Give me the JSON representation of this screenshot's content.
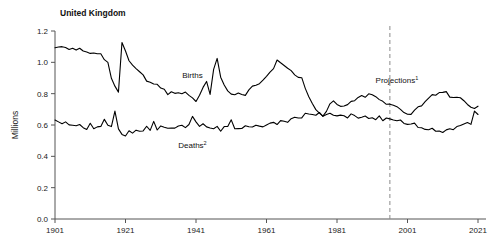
{
  "chart_data": {
    "type": "line",
    "title": "United Kingdom",
    "xlabel": "",
    "ylabel": "Millions",
    "xlim": [
      1901,
      2021
    ],
    "ylim": [
      0.0,
      1.2
    ],
    "grid": false,
    "legend_position": "inline-annotations",
    "xticks": [
      "1901",
      "1921",
      "1941",
      "1961",
      "1981",
      "2001",
      "2021"
    ],
    "xtick_values": [
      1901,
      1921,
      1941,
      1961,
      1981,
      2001,
      2021
    ],
    "yticks": [
      "0.0",
      "0.2",
      "0.4",
      "0.6",
      "0.8",
      "1.0",
      "1.2"
    ],
    "ytick_values": [
      0.0,
      0.2,
      0.4,
      0.6,
      0.8,
      1.0,
      1.2
    ],
    "annotations": [
      {
        "name": "births-label",
        "text": "Births",
        "superscript": "",
        "x": 1940,
        "y": 0.9
      },
      {
        "name": "deaths-label",
        "text": "Deaths",
        "superscript": "2",
        "x": 1940,
        "y": 0.455
      },
      {
        "name": "projections-label",
        "text": "Projections",
        "superscript": "1",
        "x": 1998,
        "y": 0.865
      }
    ],
    "projection_divider": {
      "name": "projection-divider",
      "x": 1996,
      "style": "dashed",
      "color": "#8a8a8a"
    },
    "series": [
      {
        "name": "Births",
        "color": "#000000",
        "x": [
          1901,
          1902,
          1903,
          1904,
          1905,
          1906,
          1907,
          1908,
          1909,
          1910,
          1911,
          1912,
          1913,
          1914,
          1915,
          1916,
          1917,
          1918,
          1919,
          1920,
          1921,
          1922,
          1923,
          1924,
          1925,
          1926,
          1927,
          1928,
          1929,
          1930,
          1931,
          1932,
          1933,
          1934,
          1935,
          1936,
          1937,
          1938,
          1939,
          1940,
          1941,
          1942,
          1943,
          1944,
          1945,
          1946,
          1947,
          1948,
          1949,
          1950,
          1951,
          1952,
          1953,
          1954,
          1955,
          1956,
          1957,
          1958,
          1959,
          1960,
          1961,
          1962,
          1963,
          1964,
          1965,
          1966,
          1967,
          1968,
          1969,
          1970,
          1971,
          1972,
          1973,
          1974,
          1975,
          1976,
          1977,
          1978,
          1979,
          1980,
          1981,
          1982,
          1983,
          1984,
          1985,
          1986,
          1987,
          1988,
          1989,
          1990,
          1991,
          1992,
          1993,
          1994,
          1995,
          1996,
          1997,
          1998,
          1999,
          2000,
          2001,
          2002,
          2003,
          2004,
          2005,
          2006,
          2007,
          2008,
          2009,
          2010,
          2011,
          2012,
          2013,
          2014,
          2015,
          2016,
          2017,
          2018,
          2019,
          2020,
          2021
        ],
        "values": [
          1.093,
          1.098,
          1.1,
          1.095,
          1.082,
          1.09,
          1.078,
          1.09,
          1.072,
          1.066,
          1.057,
          1.06,
          1.055,
          1.055,
          1.017,
          1.0,
          0.898,
          0.848,
          0.81,
          1.127,
          1.072,
          1.01,
          0.982,
          0.96,
          0.94,
          0.92,
          0.88,
          0.873,
          0.862,
          0.86,
          0.836,
          0.828,
          0.794,
          0.812,
          0.802,
          0.806,
          0.8,
          0.81,
          0.789,
          0.773,
          0.75,
          0.79,
          0.84,
          0.878,
          0.795,
          0.955,
          1.025,
          0.905,
          0.855,
          0.818,
          0.797,
          0.793,
          0.804,
          0.795,
          0.789,
          0.824,
          0.848,
          0.854,
          0.864,
          0.886,
          0.911,
          0.938,
          0.96,
          1.015,
          0.997,
          0.98,
          0.962,
          0.947,
          0.92,
          0.904,
          0.902,
          0.834,
          0.78,
          0.737,
          0.698,
          0.676,
          0.657,
          0.687,
          0.735,
          0.754,
          0.731,
          0.719,
          0.721,
          0.73,
          0.751,
          0.755,
          0.776,
          0.788,
          0.777,
          0.799,
          0.793,
          0.781,
          0.762,
          0.751,
          0.732,
          0.733,
          0.726,
          0.717,
          0.7,
          0.679,
          0.669,
          0.668,
          0.695,
          0.716,
          0.722,
          0.749,
          0.772,
          0.794,
          0.79,
          0.807,
          0.808,
          0.813,
          0.778,
          0.776,
          0.777,
          0.774,
          0.755,
          0.731,
          0.713,
          0.705,
          0.72
        ]
      },
      {
        "name": "Deaths",
        "color": "#000000",
        "x": [
          1901,
          1902,
          1903,
          1904,
          1905,
          1906,
          1907,
          1908,
          1909,
          1910,
          1911,
          1912,
          1913,
          1914,
          1915,
          1916,
          1917,
          1918,
          1919,
          1920,
          1921,
          1922,
          1923,
          1924,
          1925,
          1926,
          1927,
          1928,
          1929,
          1930,
          1931,
          1932,
          1933,
          1934,
          1935,
          1936,
          1937,
          1938,
          1939,
          1940,
          1941,
          1942,
          1943,
          1944,
          1945,
          1946,
          1947,
          1948,
          1949,
          1950,
          1951,
          1952,
          1953,
          1954,
          1955,
          1956,
          1957,
          1958,
          1959,
          1960,
          1961,
          1962,
          1963,
          1964,
          1965,
          1966,
          1967,
          1968,
          1969,
          1970,
          1971,
          1972,
          1973,
          1974,
          1975,
          1976,
          1977,
          1978,
          1979,
          1980,
          1981,
          1982,
          1983,
          1984,
          1985,
          1986,
          1987,
          1988,
          1989,
          1990,
          1991,
          1992,
          1993,
          1994,
          1995,
          1996,
          1997,
          1998,
          1999,
          2000,
          2001,
          2002,
          2003,
          2004,
          2005,
          2006,
          2007,
          2008,
          2009,
          2010,
          2011,
          2012,
          2013,
          2014,
          2015,
          2016,
          2017,
          2018,
          2019,
          2020,
          2021
        ],
        "values": [
          0.632,
          0.62,
          0.608,
          0.62,
          0.601,
          0.598,
          0.595,
          0.603,
          0.583,
          0.571,
          0.611,
          0.576,
          0.588,
          0.591,
          0.636,
          0.598,
          0.59,
          0.689,
          0.575,
          0.54,
          0.53,
          0.563,
          0.548,
          0.567,
          0.56,
          0.562,
          0.592,
          0.566,
          0.623,
          0.568,
          0.594,
          0.586,
          0.579,
          0.58,
          0.58,
          0.594,
          0.598,
          0.583,
          0.603,
          0.655,
          0.62,
          0.591,
          0.608,
          0.588,
          0.581,
          0.576,
          0.591,
          0.56,
          0.59,
          0.59,
          0.633,
          0.576,
          0.577,
          0.578,
          0.595,
          0.589,
          0.587,
          0.599,
          0.593,
          0.588,
          0.6,
          0.612,
          0.617,
          0.603,
          0.628,
          0.624,
          0.617,
          0.64,
          0.649,
          0.645,
          0.645,
          0.675,
          0.67,
          0.667,
          0.662,
          0.68,
          0.655,
          0.667,
          0.675,
          0.662,
          0.658,
          0.663,
          0.659,
          0.645,
          0.671,
          0.66,
          0.644,
          0.65,
          0.657,
          0.642,
          0.646,
          0.634,
          0.658,
          0.627,
          0.645,
          0.639,
          0.632,
          0.627,
          0.632,
          0.61,
          0.604,
          0.606,
          0.612,
          0.584,
          0.582,
          0.572,
          0.57,
          0.579,
          0.56,
          0.561,
          0.552,
          0.569,
          0.576,
          0.57,
          0.59,
          0.597,
          0.607,
          0.616,
          0.604,
          0.689,
          0.667
        ]
      }
    ]
  }
}
